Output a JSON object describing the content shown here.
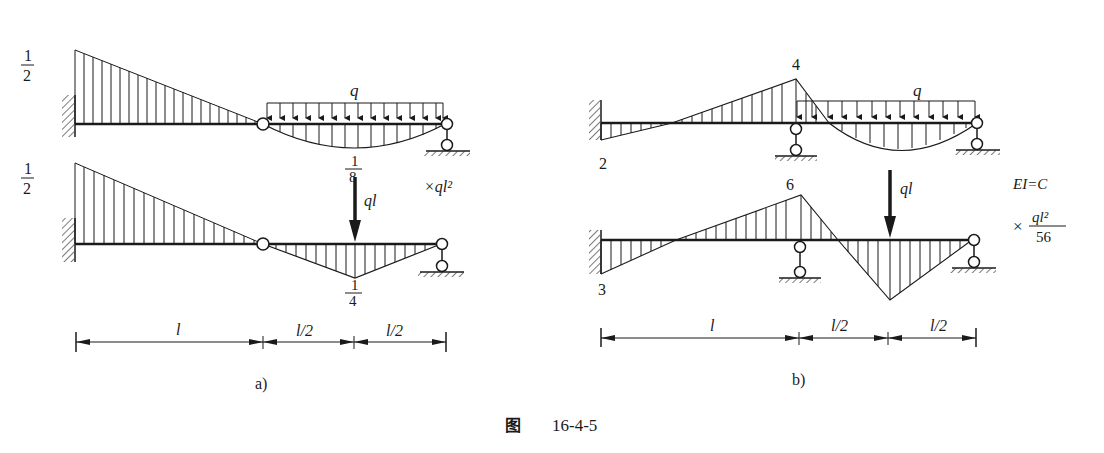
{
  "figure": {
    "caption_prefix": "图",
    "caption_number": "16-4-5"
  },
  "diagram_a": {
    "panel_label": "a)",
    "top": {
      "left_value_num": "1",
      "left_value_den": "2",
      "load_label": "q",
      "mid_value_num": "1",
      "mid_value_den": "8"
    },
    "bottom": {
      "left_value_num": "1",
      "left_value_den": "2",
      "load_label": "ql",
      "mid_value_num": "1",
      "mid_value_den": "4"
    },
    "multiplier": "×ql²",
    "dimensions": [
      "l",
      "l/2",
      "l/2"
    ]
  },
  "diagram_b": {
    "panel_label": "b)",
    "top": {
      "wall_value": "2",
      "support_value": "4",
      "load_label": "q"
    },
    "bottom": {
      "wall_value": "3",
      "support_value": "6",
      "load_label": "ql"
    },
    "stiffness": "EI=C",
    "multiplier_prefix": "×",
    "multiplier_num": "ql²",
    "multiplier_den": "56",
    "dimensions": [
      "l",
      "l/2",
      "l/2"
    ]
  }
}
